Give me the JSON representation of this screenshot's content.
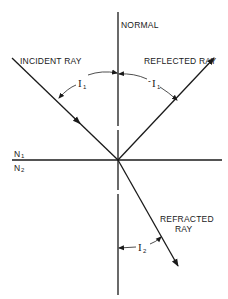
{
  "diagram": {
    "type": "optics-reflection-refraction",
    "labels": {
      "normal": "NORMAL",
      "incident_ray": "INCIDENT RAY",
      "reflected_ray": "REFLECTED RAY",
      "refracted_ray_line1": "REFRACTED",
      "refracted_ray_line2": "RAY",
      "medium_upper": "N",
      "medium_upper_sub": "1",
      "medium_lower": "N",
      "medium_lower_sub": "2",
      "angle_incidence": "I",
      "angle_incidence_sub": "1",
      "angle_reflection_prefix": "-",
      "angle_reflection": "I",
      "angle_reflection_sub": "1",
      "angle_refraction": "I",
      "angle_refraction_sub": "2"
    },
    "colors": {
      "line": "#1a1a1a",
      "background": "#ffffff"
    }
  }
}
